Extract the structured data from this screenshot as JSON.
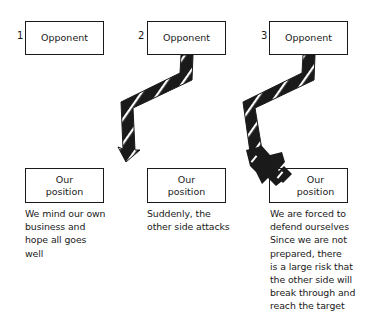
{
  "panels": [
    {
      "number": "1",
      "opponent_label": "Opponent",
      "position_label": "Our\nposition",
      "caption": "We mind our own\nbusiness and\nhope all goes\nwell"
    },
    {
      "number": "2",
      "opponent_label": "Opponent",
      "position_label": "Our\nposition",
      "caption": "Suddenly, the\nother side attacks"
    },
    {
      "number": "3",
      "opponent_label": "Opponent",
      "position_label": "Our\nposition",
      "caption": "We are forced to\ndefend ourselves\nSince we are not\nprepared, there\nis a large risk that\nthe other side will\nbreak through and\nreach the target"
    }
  ],
  "colors": {
    "ink": "#1a1a1a",
    "background": "#ffffff"
  }
}
